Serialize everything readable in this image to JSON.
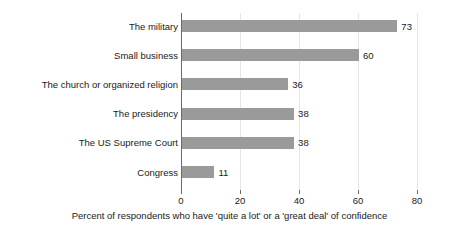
{
  "chart_data": {
    "type": "bar",
    "orientation": "horizontal",
    "title": "",
    "subtitle": "",
    "categories": [
      "The military",
      "Small business",
      "The church or organized religion",
      "The presidency",
      "The US Supreme Court",
      "Congress"
    ],
    "values": [
      73,
      60,
      36,
      38,
      38,
      11
    ],
    "data_labels": [
      "73",
      "60",
      "36",
      "38",
      "38",
      "11"
    ],
    "xlabel": "Percent of respondents who have 'quite a lot' or a 'great deal' of confidence",
    "ylabel": "",
    "xlim": [
      0,
      80
    ],
    "xticks": [
      0,
      20,
      40,
      60,
      80
    ],
    "xtick_labels": [
      "0",
      "20",
      "40",
      "60",
      "80"
    ],
    "grid": true,
    "grid_axis": "x",
    "legend": false,
    "bar_color": "#9a9a9a",
    "axis_color": "#6b6b6b",
    "grid_color": "#e6e6e6",
    "text_color": "#1a1a1a",
    "background_color": "#ffffff"
  }
}
